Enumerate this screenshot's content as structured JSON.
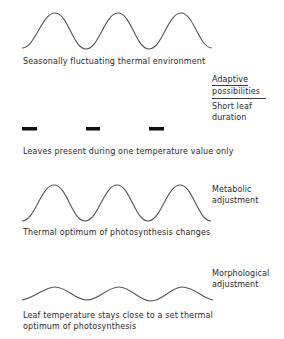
{
  "diagram": {
    "panels": [
      {
        "id": "environment",
        "caption": "Seasonally fluctuating thermal environment",
        "curve": "large-amplitude sine, 3 cycles"
      },
      {
        "id": "short-leaf",
        "caption": "Leaves present during one temperature value only",
        "side_label": [
          "Short leaf",
          "duration"
        ],
        "bars": 3
      },
      {
        "id": "metabolic",
        "caption": "Thermal optimum of photosynthesis changes",
        "side_label": [
          "Metabolic",
          "adjustment"
        ],
        "curve": "large-amplitude sine, 3 cycles"
      },
      {
        "id": "morphological",
        "caption_lines": [
          "Leaf temperature stays close to a set thermal",
          "optimum of photosynthesis"
        ],
        "side_label": [
          "Morphological",
          "adjustment"
        ],
        "curve": "small-amplitude sine, 3 cycles"
      }
    ],
    "header": {
      "line1": "Adaptive",
      "line2": "possibilities"
    },
    "colors": {
      "line": "#555555",
      "bar": "#111111",
      "text": "#2a2a2a",
      "background": "#ffffff"
    }
  }
}
